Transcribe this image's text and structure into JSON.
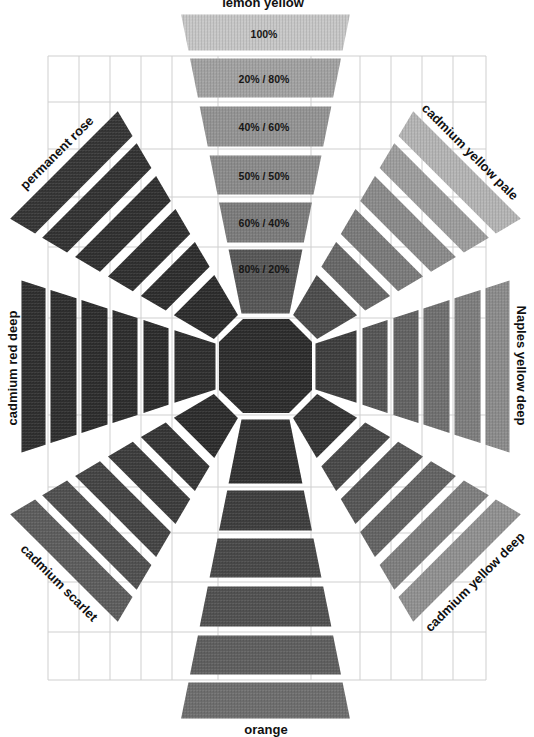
{
  "diagram": {
    "center_mix": {
      "color": "#2b2b2b"
    },
    "grid": {
      "line_color": "#cfcfcf"
    },
    "arms": [
      {
        "position": "top",
        "label": "lemon yellow",
        "bands": [
          {
            "mix": "100%",
            "color": "#c6c6c6"
          },
          {
            "mix": "20% / 80%",
            "color": "#a1a1a1"
          },
          {
            "mix": "40% / 60%",
            "color": "#939393"
          },
          {
            "mix": "50% / 50%",
            "color": "#8a8a8a"
          },
          {
            "mix": "60% / 40%",
            "color": "#7b7b7b"
          },
          {
            "mix": "80% / 20%",
            "color": "#565656"
          }
        ]
      },
      {
        "position": "top-right",
        "label": "cadmium yellow pale",
        "bands": [
          {
            "color": "#b4b4b4"
          },
          {
            "color": "#9d9d9d"
          },
          {
            "color": "#8a8a8a"
          },
          {
            "color": "#7a7a7a"
          },
          {
            "color": "#676767"
          },
          {
            "color": "#4b4b4b"
          }
        ]
      },
      {
        "position": "right",
        "label": "Naples yellow deep",
        "bands": [
          {
            "color": "#8b8b8b"
          },
          {
            "color": "#7d7d7d"
          },
          {
            "color": "#6f6f6f"
          },
          {
            "color": "#626262"
          },
          {
            "color": "#555555"
          },
          {
            "color": "#3d3d3d"
          }
        ]
      },
      {
        "position": "bottom-right",
        "label": "cadmium yellow deep",
        "bands": [
          {
            "color": "#909090"
          },
          {
            "color": "#7e7e7e"
          },
          {
            "color": "#636363"
          },
          {
            "color": "#555555"
          },
          {
            "color": "#474747"
          },
          {
            "color": "#333333"
          }
        ]
      },
      {
        "position": "bottom",
        "label": "orange",
        "bands": [
          {
            "color": "#6d6d6d"
          },
          {
            "color": "#5e5e5e"
          },
          {
            "color": "#505050"
          },
          {
            "color": "#474747"
          },
          {
            "color": "#3d3d3d"
          },
          {
            "color": "#303030"
          }
        ]
      },
      {
        "position": "bottom-left",
        "label": "cadmium scarlet",
        "bands": [
          {
            "color": "#5c5c5c"
          },
          {
            "color": "#4f4f4f"
          },
          {
            "color": "#434343"
          },
          {
            "color": "#3b3b3b"
          },
          {
            "color": "#343434"
          },
          {
            "color": "#2b2b2b"
          }
        ]
      },
      {
        "position": "left",
        "label": "cadmium red deep",
        "bands": [
          {
            "color": "#2e2e2e"
          },
          {
            "color": "#2d2d2d"
          },
          {
            "color": "#2c2c2c"
          },
          {
            "color": "#2c2c2c"
          },
          {
            "color": "#2b2b2b"
          },
          {
            "color": "#2d2d2d"
          }
        ]
      },
      {
        "position": "top-left",
        "label": "permanent rose",
        "bands": [
          {
            "color": "#343434"
          },
          {
            "color": "#313131"
          },
          {
            "color": "#2f2f2f"
          },
          {
            "color": "#2e2e2e"
          },
          {
            "color": "#2c2c2c"
          },
          {
            "color": "#2b2b2b"
          }
        ]
      }
    ]
  }
}
